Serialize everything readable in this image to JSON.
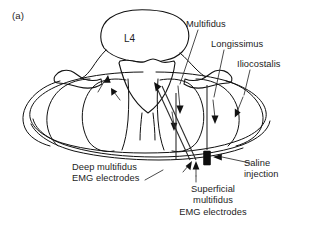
{
  "figure": {
    "panel_letter": "(a)",
    "type": "anatomical-diagram"
  },
  "labels": {
    "vertebra": "L4",
    "multifidus": "Multifidus",
    "longissimus": "Longissimus",
    "iliocostalis": "Iliocostalis",
    "deep_electrodes_line1": "Deep multifidus",
    "deep_electrodes_line2": "EMG electrodes",
    "superficial_line1": "Superficial",
    "superficial_line2": "multifidus",
    "superficial_line3": "EMG electrodes",
    "saline_line1": "Saline",
    "saline_line2": "injection"
  },
  "markers": {
    "saline_injection_marker": "filled-black-rectangle",
    "deep_electrode_probes": 2,
    "superficial_electrode_probes": 1,
    "muscle_direction_arrows": 5
  },
  "colors": {
    "background": "#ffffff",
    "outline": "#111111",
    "leader_line": "#2b2b2b",
    "text": "#1c1c1c",
    "saline_marker": "#0d0d0d"
  }
}
